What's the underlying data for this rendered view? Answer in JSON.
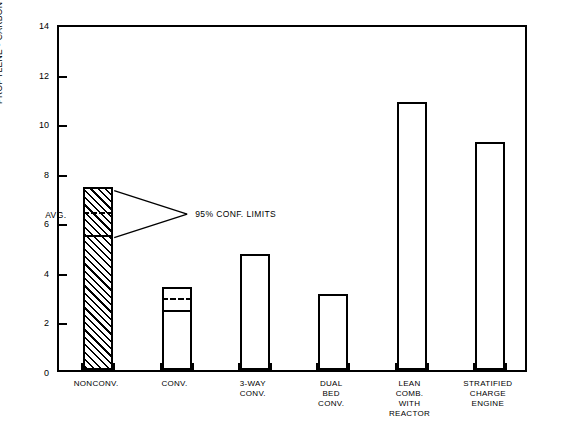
{
  "chart_data": {
    "type": "bar",
    "title": "",
    "xlabel": "",
    "ylabel": "PROPYLENE - CARBON PERCENT",
    "ylim": [
      0,
      14
    ],
    "yticks": [
      0,
      2,
      4,
      6,
      8,
      10,
      12,
      14
    ],
    "grid": false,
    "legend": "none",
    "categories": [
      "NONCONV.",
      "CONV.",
      "3-WAY\nCONV.",
      "DUAL\nBED\nCONV.",
      "LEAN\nCOMB.\nWITH\nREACTOR",
      "STRATIFIED\nCHARGE\nENGINE"
    ],
    "values": [
      7.4,
      3.35,
      4.7,
      3.05,
      10.8,
      9.2
    ],
    "bars": [
      {
        "category": "NONCONV.",
        "value": 7.4,
        "hatched": true,
        "conf_upper": 7.4,
        "average": 6.4,
        "conf_lower": 5.5
      },
      {
        "category": "CONV.",
        "value": 3.35,
        "hatched": false,
        "conf_upper": 3.35,
        "average": 2.95,
        "conf_lower": 2.45
      },
      {
        "category": "3-WAY CONV.",
        "value": 4.7,
        "hatched": false,
        "conf_upper": null,
        "average": null,
        "conf_lower": null
      },
      {
        "category": "DUAL BED CONV.",
        "value": 3.05,
        "hatched": false,
        "conf_upper": null,
        "average": null,
        "conf_lower": null
      },
      {
        "category": "LEAN COMB. WITH REACTOR",
        "value": 10.8,
        "hatched": false,
        "conf_upper": null,
        "average": null,
        "conf_lower": null
      },
      {
        "category": "STRATIFIED CHARGE ENGINE",
        "value": 9.2,
        "hatched": false,
        "conf_upper": null,
        "average": null,
        "conf_lower": null
      }
    ],
    "annotations": {
      "avg_label": "AVG.",
      "conf_label": "95% CONF. LIMITS"
    }
  },
  "axis": {
    "y_title": "PROPYLENE - CARBON PERCENT",
    "tick_labels": [
      "0",
      "2",
      "4",
      "6",
      "8",
      "10",
      "12",
      "14"
    ]
  },
  "colors": {
    "ink": "#000000",
    "paper": "#ffffff"
  }
}
